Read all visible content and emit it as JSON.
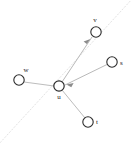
{
  "figure": {
    "type": "node-link-graph",
    "width": 135,
    "height": 145,
    "background_color": "#ffffff",
    "node_stroke_color": "#2b2b2b",
    "node_fill_color": "#ffffff",
    "edge_color": "#b4b4b4",
    "arrow_color": "#8c8c8c",
    "guide_line_color": "#e2e2e2",
    "label_color": "#1a1a1a",
    "node_radius": 5.2,
    "nodes": [
      {
        "id": "v",
        "label": "v",
        "cx": 96,
        "cy": 32,
        "label_x": 95,
        "label_y": 22,
        "label_anchor": "middle"
      },
      {
        "id": "s",
        "label": "s",
        "cx": 112,
        "cy": 62,
        "label_x": 120,
        "label_y": 65,
        "label_anchor": "start"
      },
      {
        "id": "w",
        "label": "w",
        "cx": 19,
        "cy": 80,
        "label_x": 26,
        "label_y": 72,
        "label_anchor": "middle"
      },
      {
        "id": "u",
        "label": "u",
        "cx": 59,
        "cy": 86,
        "label_x": 59,
        "label_y": 99,
        "label_anchor": "middle"
      },
      {
        "id": "t",
        "label": "t",
        "cx": 88,
        "cy": 122,
        "label_x": 96,
        "label_y": 124,
        "label_anchor": "start"
      }
    ],
    "edges": [
      {
        "id": "u-v",
        "from": "u",
        "to": "v",
        "x1": 62,
        "y1": 82,
        "x2": 92,
        "y2": 37,
        "directed": true,
        "arrow_at": "to"
      },
      {
        "id": "s-u",
        "from": "s",
        "to": "u",
        "x1": 108,
        "y1": 64,
        "x2": 65,
        "y2": 85,
        "directed": true,
        "arrow_at": "to"
      },
      {
        "id": "w-u",
        "from": "w",
        "to": "u",
        "x1": 24,
        "y1": 82,
        "x2": 54,
        "y2": 86,
        "directed": false,
        "arrow_at": "none"
      },
      {
        "id": "u-t",
        "from": "u",
        "to": "t",
        "x1": 62,
        "y1": 90,
        "x2": 85,
        "y2": 118,
        "directed": false,
        "arrow_at": "none"
      }
    ],
    "guide_line": {
      "id": "dotted-diagonal",
      "x1": -2,
      "y1": 145,
      "x2": 133,
      "y2": -2,
      "style": "dotted"
    }
  }
}
